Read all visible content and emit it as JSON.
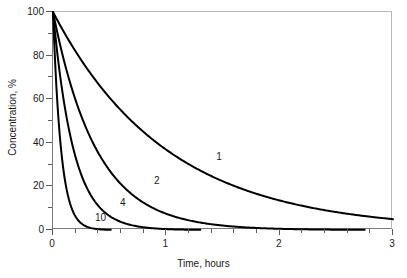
{
  "chart_data": {
    "type": "line",
    "title": "",
    "xlabel": "Time, hours",
    "ylabel": "Concentration, %",
    "xlim": [
      0,
      3
    ],
    "ylim": [
      0,
      100
    ],
    "xticks": [
      0,
      1,
      2,
      3
    ],
    "xtick_labels": [
      "0",
      "1",
      "2",
      "3"
    ],
    "xminor_step": 0.2,
    "yticks": [
      0,
      20,
      40,
      60,
      80,
      100
    ],
    "ytick_labels": [
      "0",
      "20",
      "40",
      "60",
      "80",
      "100"
    ],
    "yminor_step": 10,
    "grid": false,
    "legend": "inline-curve-labels",
    "line_color": "#000000",
    "line_width": 2,
    "series": [
      {
        "name": "1",
        "label": "1",
        "decay_rate_per_hour": 1.0,
        "x": [
          0,
          0.1,
          0.2,
          0.3,
          0.4,
          0.5,
          0.6,
          0.8,
          1.0,
          1.2,
          1.4,
          1.6,
          1.8,
          2.0,
          2.2,
          2.4,
          2.6,
          2.8,
          3.0
        ],
        "values": [
          100,
          90,
          81,
          73,
          66,
          60,
          54,
          44,
          36,
          29,
          24,
          20,
          16,
          13,
          11,
          9,
          8,
          6,
          5
        ]
      },
      {
        "name": "2",
        "label": "2",
        "decay_rate_per_hour": 2.6,
        "x": [
          0,
          0.1,
          0.2,
          0.3,
          0.4,
          0.5,
          0.6,
          0.8,
          1.0,
          1.2,
          1.4,
          1.6,
          1.8,
          2.0,
          2.2,
          2.4,
          2.6,
          2.8,
          3.0
        ],
        "values": [
          100,
          77,
          59,
          46,
          35,
          27,
          21,
          12,
          7,
          4,
          3,
          2,
          1,
          1,
          0,
          0,
          0,
          0,
          0
        ]
      },
      {
        "name": "4",
        "label": "4",
        "decay_rate_per_hour": 5.5,
        "x": [
          0,
          0.05,
          0.1,
          0.15,
          0.2,
          0.3,
          0.4,
          0.5,
          0.6,
          0.7,
          0.8,
          0.9,
          1.0,
          1.1,
          1.2
        ],
        "values": [
          100,
          76,
          58,
          44,
          33,
          19,
          11,
          6,
          4,
          2,
          1,
          1,
          0,
          0,
          0
        ]
      },
      {
        "name": "10",
        "label": "10",
        "decay_rate_per_hour": 14.0,
        "x": [
          0,
          0.025,
          0.05,
          0.075,
          0.1,
          0.15,
          0.2,
          0.25,
          0.3,
          0.35,
          0.4,
          0.45,
          0.5,
          0.55,
          0.6
        ],
        "values": [
          100,
          70,
          50,
          35,
          25,
          12,
          6,
          3,
          1.5,
          0.7,
          0.4,
          0.2,
          0.1,
          0,
          0
        ]
      }
    ],
    "annotations": [
      {
        "text": "1",
        "x": 1.45,
        "y": 33
      },
      {
        "text": "2",
        "x": 0.9,
        "y": 22
      },
      {
        "text": "4",
        "x": 0.6,
        "y": 12
      },
      {
        "text": "10",
        "x": 0.38,
        "y": 5
      }
    ]
  },
  "axes": {
    "x_title": "Time, hours",
    "y_title": "Concentration, %"
  }
}
